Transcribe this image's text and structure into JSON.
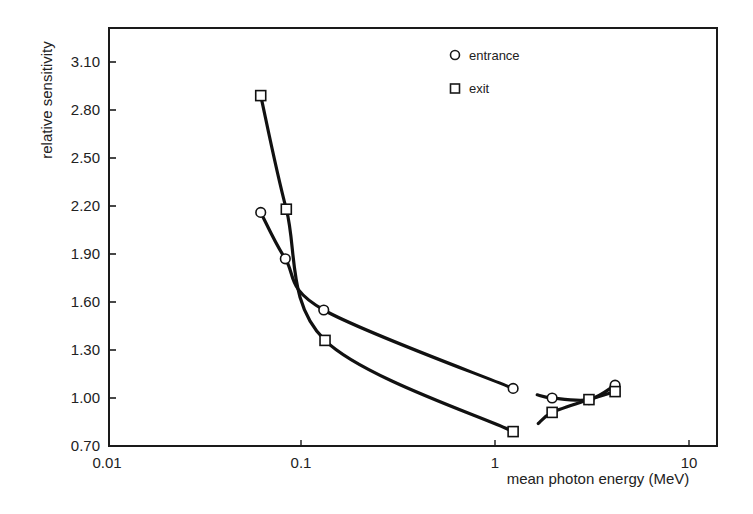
{
  "chart_data": {
    "type": "line",
    "title": "",
    "xlabel": "mean photon energy (MeV)",
    "ylabel": "relative sensitivity",
    "xscale": "log",
    "xlim": [
      0.01,
      15
    ],
    "ylim": [
      0.7,
      3.3
    ],
    "x_ticks": [
      0.01,
      0.1,
      1,
      10
    ],
    "x_tick_labels": [
      "0.01",
      "0.1",
      "1",
      "10"
    ],
    "y_ticks": [
      0.7,
      1.0,
      1.3,
      1.6,
      1.9,
      2.2,
      2.5,
      2.8,
      3.1
    ],
    "y_tick_labels": [
      "0.70",
      "1.00",
      "1.30",
      "1.60",
      "1.90",
      "2.20",
      "2.50",
      "2.80",
      "3.10"
    ],
    "grid": false,
    "legend_position": "top-center-right",
    "series": [
      {
        "name": "entrance",
        "marker": "circle",
        "segments": [
          {
            "x": [
              0.062,
              0.083,
              0.131,
              1.24
            ],
            "y": [
              2.16,
              1.87,
              1.55,
              1.06
            ]
          },
          {
            "x": [
              1.65,
              1.97,
              3.05,
              4.16
            ],
            "y": [
              1.02,
              1.0,
              0.99,
              1.08
            ],
            "marker_from": 1
          }
        ]
      },
      {
        "name": "exit",
        "marker": "square",
        "segments": [
          {
            "x": [
              0.062,
              0.084,
              0.133,
              1.24
            ],
            "y": [
              2.89,
              2.18,
              1.36,
              0.79
            ]
          },
          {
            "x": [
              1.67,
              1.97,
              3.05,
              4.16
            ],
            "y": [
              0.84,
              0.91,
              0.99,
              1.04
            ],
            "marker_from": 1
          }
        ]
      }
    ]
  },
  "legend": {
    "items": [
      {
        "label": "entrance",
        "marker": "circle"
      },
      {
        "label": "exit",
        "marker": "square"
      }
    ]
  },
  "axes": {
    "x_title": "mean photon energy (MeV)",
    "y_title": "relative sensitivity"
  }
}
